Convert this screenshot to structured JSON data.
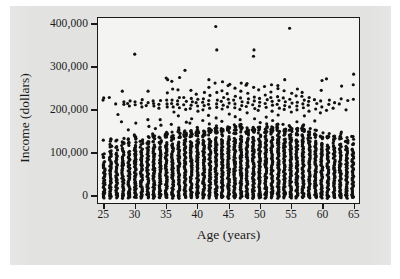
{
  "chart_data": {
    "type": "scatter",
    "title": "",
    "xlabel": "Age (years)",
    "ylabel": "Income (dollars)",
    "xlim": [
      24.0,
      66.0
    ],
    "ylim": [
      -20000,
      415000
    ],
    "xticks": [
      25,
      30,
      35,
      40,
      45,
      50,
      55,
      60,
      65
    ],
    "xtick_labels": [
      "25",
      "30",
      "35",
      "40",
      "45",
      "50",
      "55",
      "60",
      "65"
    ],
    "yticks": [
      0,
      100000,
      200000,
      300000,
      400000
    ],
    "ytick_labels": [
      "0",
      "100,000",
      "200,000",
      "300,000",
      "400,000"
    ],
    "grid": false,
    "legend": null,
    "marker": {
      "shape": "circle",
      "color": "#111111",
      "size_px": 3.2
    },
    "plot_background": "#f4f4f2",
    "panel_background": "#e3e3e1",
    "axis_color": "#1a1a1a",
    "column_profile": [
      {
        "age": 25,
        "dense_top": 80000,
        "mid_count": 5,
        "mid_top": 120000,
        "upper": [
          222000,
          227000
        ]
      },
      {
        "age": 26,
        "dense_top": 106000,
        "mid_count": 6,
        "mid_top": 130000,
        "upper": [
          228000
        ]
      },
      {
        "age": 27,
        "dense_top": 100000,
        "mid_count": 5,
        "mid_top": 124000,
        "upper": [
          188000,
          213000
        ]
      },
      {
        "age": 28,
        "dense_top": 112000,
        "mid_count": 7,
        "mid_top": 132000,
        "upper": [
          171000,
          212000,
          218000,
          243000
        ]
      },
      {
        "age": 29,
        "dense_top": 104000,
        "mid_count": 6,
        "mid_top": 128000,
        "upper": [
          152000,
          208000,
          214000,
          220000
        ]
      },
      {
        "age": 30,
        "dense_top": 118000,
        "mid_count": 7,
        "mid_top": 136000,
        "upper": [
          168000,
          211000,
          218000,
          330000
        ]
      },
      {
        "age": 31,
        "dense_top": 110000,
        "mid_count": 6,
        "mid_top": 130000,
        "upper": [
          206000,
          215000,
          223000
        ]
      },
      {
        "age": 32,
        "dense_top": 114000,
        "mid_count": 7,
        "mid_top": 134000,
        "upper": [
          160000,
          176000,
          209000,
          216000,
          243000
        ]
      },
      {
        "age": 33,
        "dense_top": 120000,
        "mid_count": 8,
        "mid_top": 140000,
        "upper": [
          155000,
          208000,
          214000,
          220000
        ]
      },
      {
        "age": 34,
        "dense_top": 116000,
        "mid_count": 7,
        "mid_top": 136000,
        "upper": [
          163000,
          176000,
          203000,
          212000,
          221000
        ]
      },
      {
        "age": 35,
        "dense_top": 124000,
        "mid_count": 8,
        "mid_top": 142000,
        "upper": [
          206000,
          213000,
          222000,
          239000,
          270000,
          274000
        ]
      },
      {
        "age": 36,
        "dense_top": 122000,
        "mid_count": 8,
        "mid_top": 140000,
        "upper": [
          165000,
          194000,
          206000,
          214000,
          222000,
          248000,
          266000
        ]
      },
      {
        "age": 37,
        "dense_top": 126000,
        "mid_count": 9,
        "mid_top": 146000,
        "upper": [
          157000,
          185000,
          204000,
          212000,
          220000,
          228000,
          246000,
          275000
        ]
      },
      {
        "age": 38,
        "dense_top": 130000,
        "mid_count": 9,
        "mid_top": 148000,
        "upper": [
          170000,
          200000,
          211000,
          219000,
          228000,
          292000
        ]
      },
      {
        "age": 39,
        "dense_top": 128000,
        "mid_count": 9,
        "mid_top": 146000,
        "upper": [
          168000,
          178000,
          202000,
          210000,
          218000,
          226000,
          245000
        ]
      },
      {
        "age": 40,
        "dense_top": 132000,
        "mid_count": 10,
        "mid_top": 150000,
        "upper": [
          158000,
          196000,
          208000,
          216000,
          224000,
          236000
        ]
      },
      {
        "age": 41,
        "dense_top": 130000,
        "mid_count": 9,
        "mid_top": 148000,
        "upper": [
          174000,
          199000,
          209000,
          217000,
          225000,
          240000
        ]
      },
      {
        "age": 42,
        "dense_top": 134000,
        "mid_count": 10,
        "mid_top": 152000,
        "upper": [
          166000,
          186000,
          203000,
          212000,
          221000,
          233000,
          252000,
          270000
        ]
      },
      {
        "age": 43,
        "dense_top": 136000,
        "mid_count": 10,
        "mid_top": 154000,
        "upper": [
          180000,
          205000,
          213000,
          222000,
          240000,
          262000,
          340000,
          395000
        ]
      },
      {
        "age": 44,
        "dense_top": 132000,
        "mid_count": 9,
        "mid_top": 150000,
        "upper": [
          172000,
          201000,
          210000,
          219000,
          228000,
          244000,
          265000
        ]
      },
      {
        "age": 45,
        "dense_top": 138000,
        "mid_count": 10,
        "mid_top": 156000,
        "upper": [
          189000,
          206000,
          215000,
          224000,
          237000,
          256000,
          259000
        ]
      },
      {
        "age": 46,
        "dense_top": 134000,
        "mid_count": 10,
        "mid_top": 152000,
        "upper": [
          164000,
          183000,
          204000,
          213000,
          222000,
          231000,
          250000
        ]
      },
      {
        "age": 47,
        "dense_top": 140000,
        "mid_count": 10,
        "mid_top": 158000,
        "upper": [
          176000,
          200000,
          209000,
          218000,
          227000,
          243000,
          262000
        ]
      },
      {
        "age": 48,
        "dense_top": 136000,
        "mid_count": 10,
        "mid_top": 154000,
        "upper": [
          192000,
          207000,
          216000,
          225000,
          238000,
          257000,
          261000
        ]
      },
      {
        "age": 49,
        "dense_top": 138000,
        "mid_count": 10,
        "mid_top": 156000,
        "upper": [
          178000,
          202000,
          211000,
          220000,
          229000,
          252000,
          325000,
          340000
        ]
      },
      {
        "age": 50,
        "dense_top": 134000,
        "mid_count": 9,
        "mid_top": 152000,
        "upper": [
          169000,
          198000,
          208000,
          217000,
          226000,
          246000
        ]
      },
      {
        "age": 51,
        "dense_top": 140000,
        "mid_count": 10,
        "mid_top": 158000,
        "upper": [
          182000,
          205000,
          214000,
          223000,
          234000,
          254000
        ]
      },
      {
        "age": 52,
        "dense_top": 136000,
        "mid_count": 9,
        "mid_top": 154000,
        "upper": [
          174000,
          196000,
          210000,
          219000,
          228000,
          241000,
          258000
        ]
      },
      {
        "age": 53,
        "dense_top": 142000,
        "mid_count": 10,
        "mid_top": 160000,
        "upper": [
          187000,
          203000,
          212000,
          221000,
          230000,
          249000,
          256000
        ]
      },
      {
        "age": 54,
        "dense_top": 134000,
        "mid_count": 9,
        "mid_top": 152000,
        "upper": [
          165000,
          200000,
          209000,
          218000,
          227000,
          244000,
          270000
        ]
      },
      {
        "age": 55,
        "dense_top": 138000,
        "mid_count": 9,
        "mid_top": 156000,
        "upper": [
          194000,
          206000,
          215000,
          224000,
          238000,
          391000
        ]
      },
      {
        "age": 56,
        "dense_top": 132000,
        "mid_count": 9,
        "mid_top": 150000,
        "upper": [
          171000,
          199000,
          208000,
          217000,
          232000,
          248000
        ]
      },
      {
        "age": 57,
        "dense_top": 144000,
        "mid_count": 10,
        "mid_top": 162000,
        "upper": [
          185000,
          204000,
          213000,
          222000,
          231000,
          240000
        ]
      },
      {
        "age": 58,
        "dense_top": 130000,
        "mid_count": 8,
        "mid_top": 148000,
        "upper": [
          155000,
          196000,
          210000,
          219000,
          228000
        ]
      },
      {
        "age": 59,
        "dense_top": 128000,
        "mid_count": 8,
        "mid_top": 146000,
        "upper": [
          173000,
          201000,
          214000,
          223000
        ]
      },
      {
        "age": 60,
        "dense_top": 124000,
        "mid_count": 7,
        "mid_top": 142000,
        "upper": [
          192000,
          206000,
          220000,
          245000,
          268000
        ]
      },
      {
        "age": 61,
        "dense_top": 120000,
        "mid_count": 7,
        "mid_top": 138000,
        "upper": [
          198000,
          212000,
          222000,
          272000
        ]
      },
      {
        "age": 62,
        "dense_top": 118000,
        "mid_count": 6,
        "mid_top": 134000,
        "upper": [
          203000,
          216000
        ]
      },
      {
        "age": 63,
        "dense_top": 122000,
        "mid_count": 7,
        "mid_top": 140000,
        "upper": [
          213000,
          225000,
          255000
        ]
      },
      {
        "age": 64,
        "dense_top": 116000,
        "mid_count": 6,
        "mid_top": 132000,
        "upper": [
          199000,
          221000
        ]
      },
      {
        "age": 65,
        "dense_top": 110000,
        "mid_count": 6,
        "mid_top": 130000,
        "upper": [
          224000,
          258000,
          283000
        ]
      }
    ]
  }
}
